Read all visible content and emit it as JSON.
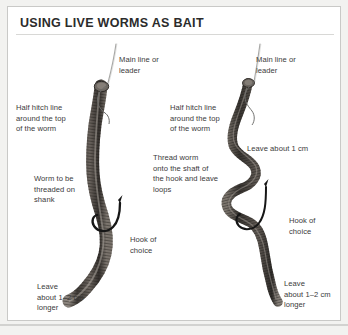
{
  "figure": {
    "title": "USING LIVE WORMS AS BAIT",
    "background_color": "#ffffff",
    "border_color": "#c9c9c7",
    "text_color": "#3a3a3a",
    "title_color": "#2b2b2b"
  },
  "labels": {
    "left_main_line": "Main line or\nleader",
    "left_half_hitch": "Half hitch line\naround the top\nof the worm",
    "left_worm_threaded": "Worm to be\nthreaded on\nshank",
    "left_hook_of_choice": "Hook of\nchoice",
    "left_leave_longer": "Leave\nabout 1–2 cm\nlonger",
    "right_main_line": "Main line or\nleader",
    "right_half_hitch": "Half hitch line\naround the top\nof the worm",
    "right_thread_worm": "Thread worm\nonto the shaft of\nthe hook and leave\nloops",
    "right_leave_about": "Leave about 1 cm",
    "right_hook_of_choice": "Hook of\nchoice",
    "right_leave_longer": "Leave\nabout 1–2 cm\nlonger"
  },
  "illustration": {
    "left_worm_name": "worm-threaded-on-shank-illustration",
    "right_worm_name": "worm-with-loops-illustration",
    "worm_color": "#4a4440",
    "line_color": "#9a9a98",
    "hook_color": "#1e1e1e"
  }
}
